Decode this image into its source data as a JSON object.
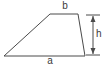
{
  "figure": {
    "type": "geometry-diagram",
    "shape": "trapezoid",
    "background_color": "#ffffff",
    "stroke_color": "#4a4a4a",
    "label_color": "#3a3a3a",
    "labels": {
      "top_base": "b",
      "bottom_base": "a",
      "height": "h"
    },
    "geometry": {
      "trapezoid_points": "4,56 50,14 78,14 85,56",
      "vertices": {
        "bottom_left": [
          4,
          56
        ],
        "top_left": [
          50,
          14
        ],
        "top_right": [
          78,
          14
        ],
        "bottom_right": [
          85,
          56
        ]
      },
      "dimension_line": {
        "x": 93,
        "y_top": 15,
        "y_bottom": 55,
        "tick_top_x1": 86,
        "tick_top_x2": 100,
        "tick_bottom_x1": 86,
        "tick_bottom_x2": 100
      }
    }
  }
}
